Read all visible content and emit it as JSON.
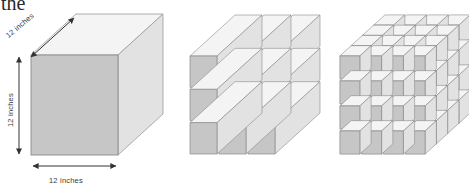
{
  "page": {
    "background_color": "#ffffff",
    "cut_off_word": "the",
    "caption": ""
  },
  "figure_group": {
    "name": "cube-subdivision-illustration",
    "count": 3,
    "figures": [
      {
        "id": "solid-cube",
        "title": "12 inch solid cube",
        "divisions": 1,
        "labels": {
          "depth": "12 inches",
          "height": "12 inches",
          "width": "12 inches"
        }
      },
      {
        "id": "cube-sliced-3x3",
        "title": "Cube cut into 9 square columns",
        "divisions": 3,
        "columns": 3,
        "rows": 3,
        "front_cells": 9
      },
      {
        "id": "cube-sliced-4x4x4",
        "title": "Cube cut into small cubes",
        "divisions": 4,
        "columns": 4,
        "rows": 4,
        "front_cells": 16
      }
    ]
  },
  "colors": {
    "front_face": "#c6c6c6",
    "top_face": "#f4f4f4",
    "side_face": "#e2e2e2",
    "edge_stroke": "#8a8a8a",
    "light_edge": "#bdbdbd",
    "arrow": "#333333",
    "text": "#3a3a3a",
    "background": "#ffffff"
  },
  "arrows": {
    "depth_arrow": "double-headed-diagonal-arrow",
    "height_arrow": "double-headed-vertical-arrow",
    "width_arrow": "double-headed-horizontal-arrow"
  }
}
